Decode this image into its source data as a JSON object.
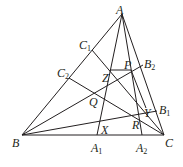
{
  "diagram": {
    "stroke_color": "#231f20",
    "points": {
      "A": {
        "x": 122,
        "y": 14
      },
      "B": {
        "x": 22,
        "y": 135
      },
      "C": {
        "x": 164,
        "y": 135
      },
      "A1": {
        "x": 97,
        "y": 135
      },
      "A2": {
        "x": 142,
        "y": 135
      },
      "B1": {
        "x": 157,
        "y": 111
      },
      "B2": {
        "x": 143,
        "y": 65
      },
      "C1": {
        "x": 92,
        "y": 50
      },
      "C2": {
        "x": 69,
        "y": 78
      },
      "P": {
        "x": 131,
        "y": 70
      },
      "Z": {
        "x": 110,
        "y": 70
      },
      "Q": {
        "x": 95,
        "y": 94
      },
      "X": {
        "x": 99,
        "y": 124
      },
      "Y": {
        "x": 146,
        "y": 108
      },
      "R": {
        "x": 139,
        "y": 114
      }
    },
    "segments": [
      [
        "A",
        "B"
      ],
      [
        "B",
        "C"
      ],
      [
        "C",
        "A"
      ],
      [
        "A",
        "A1"
      ],
      [
        "A",
        "A2"
      ],
      [
        "B",
        "B1"
      ],
      [
        "B",
        "B2"
      ],
      [
        "C",
        "C1"
      ],
      [
        "C",
        "C2"
      ],
      [
        "Z",
        "P"
      ],
      [
        "P",
        "Y"
      ]
    ],
    "labels": [
      {
        "name": "A",
        "base": "A",
        "sub": "",
        "x": 116,
        "y": 4
      },
      {
        "name": "B",
        "base": "B",
        "sub": "",
        "x": 12,
        "y": 137
      },
      {
        "name": "C",
        "base": "C",
        "sub": "",
        "x": 165,
        "y": 137
      },
      {
        "name": "A1",
        "base": "A",
        "sub": "1",
        "x": 91,
        "y": 142
      },
      {
        "name": "A2",
        "base": "A",
        "sub": "2",
        "x": 136,
        "y": 142
      },
      {
        "name": "B1",
        "base": "B",
        "sub": "1",
        "x": 159,
        "y": 104
      },
      {
        "name": "B2",
        "base": "B",
        "sub": "2",
        "x": 144,
        "y": 58
      },
      {
        "name": "C1",
        "base": "C",
        "sub": "1",
        "x": 79,
        "y": 39
      },
      {
        "name": "C2",
        "base": "C",
        "sub": "2",
        "x": 57,
        "y": 67
      },
      {
        "name": "P",
        "base": "P",
        "sub": "",
        "x": 124,
        "y": 59
      },
      {
        "name": "Z",
        "base": "Z",
        "sub": "",
        "x": 102,
        "y": 72
      },
      {
        "name": "Q",
        "base": "Q",
        "sub": "",
        "x": 89,
        "y": 96
      },
      {
        "name": "X",
        "base": "X",
        "sub": "",
        "x": 101,
        "y": 124
      },
      {
        "name": "Y",
        "base": "Y",
        "sub": "",
        "x": 144,
        "y": 107
      },
      {
        "name": "R",
        "base": "R",
        "sub": "",
        "x": 132,
        "y": 119
      }
    ]
  }
}
